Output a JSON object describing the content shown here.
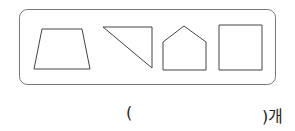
{
  "figure": {
    "shapes": [
      {
        "name": "trapezoid",
        "points": "42,29 82,29 90,69 34,69"
      },
      {
        "name": "right-triangle",
        "points": "103,27 152,27 152,68"
      },
      {
        "name": "pentagon",
        "points": "184,26 206,42 206,70 163,70 163,42"
      },
      {
        "name": "square",
        "points": "219,25 262,25 262,70 219,70"
      }
    ],
    "stroke_color": "#444444",
    "frame_color": "#666666"
  },
  "answer": {
    "open": "(",
    "close": ")개"
  }
}
